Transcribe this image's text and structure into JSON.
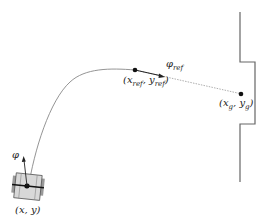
{
  "diagram": {
    "labels": {
      "robot_pose": "(x, y)",
      "heading": "φ",
      "ref_point_x": "x",
      "ref_point_y": "y",
      "ref_sub": "ref",
      "ref_heading": "φ",
      "goal_x": "x",
      "goal_y": "y",
      "goal_sub": "g"
    },
    "colors": {
      "stroke": "#555555",
      "path": "#888888",
      "point": "#111111",
      "robot_fill": "#d8d8d8"
    }
  }
}
